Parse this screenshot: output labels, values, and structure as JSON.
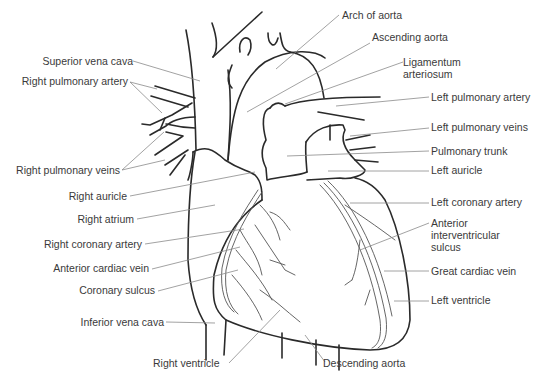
{
  "diagram": {
    "colors": {
      "outline": "#2a2a2a",
      "leader": "#8a8a8a",
      "text": "#3a3a3a",
      "vessel": "#555555"
    },
    "labels_left": [
      {
        "id": "superior-vena-cava",
        "text": "Superior vena cava"
      },
      {
        "id": "right-pulmonary-artery",
        "text": "Right pulmonary artery"
      },
      {
        "id": "right-pulmonary-veins",
        "text": "Right pulmonary veins"
      },
      {
        "id": "right-auricle",
        "text": "Right auricle"
      },
      {
        "id": "right-atrium",
        "text": "Right atrium"
      },
      {
        "id": "right-coronary-artery",
        "text": "Right coronary artery"
      },
      {
        "id": "anterior-cardiac-vein",
        "text": "Anterior cardiac vein"
      },
      {
        "id": "coronary-sulcus",
        "text": "Coronary sulcus"
      },
      {
        "id": "inferior-vena-cava",
        "text": "Inferior vena cava"
      }
    ],
    "labels_right": [
      {
        "id": "arch-of-aorta",
        "text": "Arch of aorta"
      },
      {
        "id": "ascending-aorta",
        "text": "Ascending aorta"
      },
      {
        "id": "ligamentum-arteriosum",
        "text": "Ligamentum\narteriosum"
      },
      {
        "id": "left-pulmonary-artery",
        "text": "Left pulmonary artery"
      },
      {
        "id": "left-pulmonary-veins",
        "text": "Left pulmonary veins"
      },
      {
        "id": "pulmonary-trunk",
        "text": "Pulmonary trunk"
      },
      {
        "id": "left-auricle",
        "text": "Left auricle"
      },
      {
        "id": "left-coronary-artery",
        "text": "Left coronary artery"
      },
      {
        "id": "anterior-interventricular-sulcus",
        "text": "Anterior\ninterventricular\nsulcus"
      },
      {
        "id": "great-cardiac-vein",
        "text": "Great cardiac vein"
      },
      {
        "id": "left-ventricle",
        "text": "Left ventricle"
      }
    ],
    "labels_bottom": [
      {
        "id": "right-ventricle",
        "text": "Right ventricle"
      },
      {
        "id": "descending-aorta",
        "text": "Descending aorta"
      }
    ]
  }
}
